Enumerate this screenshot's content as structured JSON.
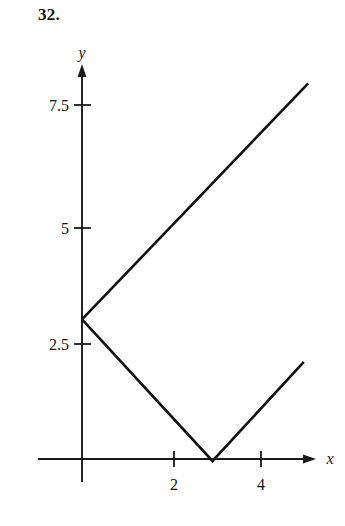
{
  "problem": {
    "number": "32."
  },
  "chart_data": {
    "type": "line",
    "title": "",
    "subtitle": "",
    "xlabel": "x",
    "ylabel": "y",
    "xlim": [
      -0.45,
      5.9
    ],
    "ylim": [
      -0.55,
      8.6
    ],
    "grid": false,
    "legend": null,
    "xticks": [
      2,
      4
    ],
    "xtick_labels": [
      "2",
      "4"
    ],
    "yticks": [
      2.5,
      5,
      7.5
    ],
    "ytick_labels": [
      "2.5",
      "5",
      "7.5"
    ],
    "axis_arrows": {
      "x": "right",
      "y": "up"
    },
    "series": [
      {
        "name": "upper-ray",
        "type": "line",
        "x": [
          0,
          5.2
        ],
        "y": [
          3,
          8.0
        ],
        "color": "#111111",
        "width": 2.6
      },
      {
        "name": "v-branch",
        "type": "line",
        "x": [
          0,
          3,
          5.1
        ],
        "y": [
          3,
          0,
          2.1
        ],
        "color": "#111111",
        "width": 2.6
      }
    ],
    "annotations": [
      {
        "label": "branch point",
        "x": 0,
        "y": 3
      },
      {
        "label": "vertex",
        "x": 3,
        "y": 0
      }
    ]
  },
  "colors": {
    "background": "#ffffff",
    "ink": "#111111",
    "axis": "#1a1a1a"
  }
}
